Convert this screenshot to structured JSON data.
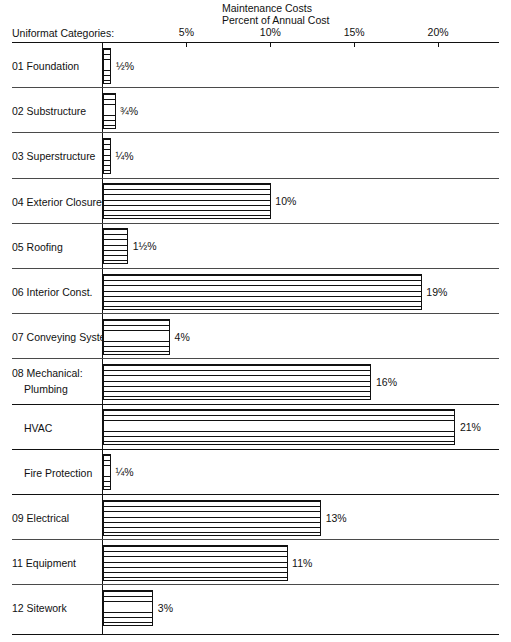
{
  "chart_data": {
    "type": "bar",
    "orientation": "horizontal",
    "title": "Maintenance Costs",
    "subtitle": "Percent of Annual Cost",
    "xlabel": "Percent of Annual Cost",
    "ylabel": "Uniformat Categories:",
    "grid": false,
    "legend": "none",
    "xlim": [
      0,
      24
    ],
    "xticks": [
      5,
      10,
      15,
      20
    ],
    "xticklabels": [
      "5%",
      "10%",
      "15%",
      "20%"
    ],
    "categories": [
      "01  Foundation",
      "02  Substructure",
      "03  Superstructure",
      "04  Exterior Closure",
      "05  Roofing",
      "06  Interior Const.",
      "07  Conveying System",
      "08  Mechanical: Plumbing",
      "HVAC",
      "Fire Protection",
      "09  Electrical",
      "11  Equipment",
      "12  Sitework"
    ],
    "values": [
      0.5,
      0.75,
      0.25,
      10,
      1.5,
      19,
      4,
      16,
      21,
      0.25,
      13,
      11,
      3
    ],
    "value_labels": [
      "½%",
      "¾%",
      "¼%",
      "10%",
      "1½%",
      "19%",
      "4%",
      "16%",
      "21%",
      "¼%",
      "13%",
      "11%",
      "3%"
    ]
  },
  "header": {
    "title": "Maintenance Costs",
    "subtitle": "Percent of Annual Cost",
    "axis_caption": "Uniformat Categories:"
  },
  "axis": {
    "ticks": [
      {
        "label": "5%",
        "value": 5
      },
      {
        "label": "10%",
        "value": 10
      },
      {
        "label": "15%",
        "value": 15
      },
      {
        "label": "20%",
        "value": 20
      }
    ]
  },
  "rows": [
    {
      "num": "01",
      "name": "Foundation",
      "label": "01  Foundation",
      "value": 0.5,
      "value_label": "½%",
      "indent": false,
      "two_line": false
    },
    {
      "num": "02",
      "name": "Substructure",
      "label": "02  Substructure",
      "value": 0.75,
      "value_label": "¾%",
      "indent": false,
      "two_line": false
    },
    {
      "num": "03",
      "name": "Superstructure",
      "label": "03  Superstructure",
      "value": 0.25,
      "value_label": "¼%",
      "indent": false,
      "two_line": false
    },
    {
      "num": "04",
      "name": "Exterior Closure",
      "label": "04  Exterior Closure",
      "value": 10,
      "value_label": "10%",
      "indent": false,
      "two_line": false
    },
    {
      "num": "05",
      "name": "Roofing",
      "label": "05  Roofing",
      "value": 1.5,
      "value_label": "1½%",
      "indent": false,
      "two_line": false
    },
    {
      "num": "06",
      "name": "Interior Const.",
      "label": "06  Interior Const.",
      "value": 19,
      "value_label": "19%",
      "indent": false,
      "two_line": false
    },
    {
      "num": "07",
      "name": "Conveying System",
      "label": "07  Conveying System",
      "value": 4,
      "value_label": "4%",
      "indent": false,
      "two_line": false
    },
    {
      "num": "08",
      "name": "Mechanical:",
      "label": "08  Mechanical:",
      "label2": "Plumbing",
      "value": 16,
      "value_label": "16%",
      "indent": false,
      "two_line": true
    },
    {
      "num": "",
      "name": "HVAC",
      "label": "HVAC",
      "value": 21,
      "value_label": "21%",
      "indent": true,
      "two_line": false
    },
    {
      "num": "",
      "name": "Fire Protection",
      "label": "Fire Protection",
      "value": 0.25,
      "value_label": "¼%",
      "indent": true,
      "two_line": false
    },
    {
      "num": "09",
      "name": "Electrical",
      "label": "09  Electrical",
      "value": 13,
      "value_label": "13%",
      "indent": false,
      "two_line": false
    },
    {
      "num": "11",
      "name": "Equipment",
      "label": "11  Equipment",
      "value": 11,
      "value_label": "11%",
      "indent": false,
      "two_line": false
    },
    {
      "num": "12",
      "name": "Sitework",
      "label": "12  Sitework",
      "value": 3,
      "value_label": "3%",
      "indent": false,
      "two_line": false
    }
  ],
  "colors": {
    "ink": "#111111",
    "rule": "#4a4a4a",
    "background": "#ffffff"
  }
}
